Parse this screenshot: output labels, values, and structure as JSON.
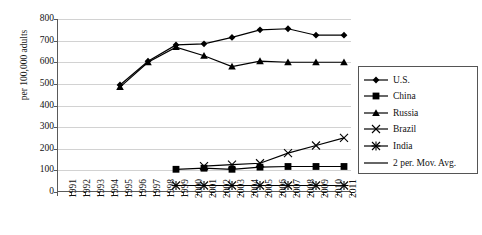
{
  "chart_data": {
    "type": "line",
    "title": "",
    "xlabel": "",
    "ylabel": "per 100,000 adults",
    "ylim": [
      0,
      800
    ],
    "ytick_step": 100,
    "grid": true,
    "legend_position": "right",
    "categories": [
      "1991",
      "1992",
      "1993",
      "1994",
      "1995",
      "1996",
      "1997",
      "1998",
      "1999",
      "2000",
      "2001",
      "2002",
      "2003",
      "2004",
      "2005",
      "2006",
      "2007",
      "2008",
      "2009",
      "2010",
      "2011"
    ],
    "yticks": [
      "0",
      "100",
      "200",
      "300",
      "400",
      "500",
      "600",
      "700",
      "800"
    ],
    "series": [
      {
        "name": "U.S.",
        "marker": "diamond",
        "x": [
          "1995",
          "1997",
          "1999",
          "2001",
          "2003",
          "2005",
          "2007",
          "2009",
          "2011"
        ],
        "values": [
          495,
          605,
          680,
          685,
          715,
          750,
          755,
          725,
          725
        ]
      },
      {
        "name": "China",
        "marker": "square",
        "x": [
          "1999",
          "2001",
          "2003",
          "2005",
          "2007",
          "2009",
          "2011"
        ],
        "values": [
          105,
          110,
          105,
          115,
          118,
          118,
          118
        ]
      },
      {
        "name": "Russia",
        "marker": "triangle",
        "x": [
          "1995",
          "1997",
          "1999",
          "2001",
          "2003",
          "2005",
          "2007",
          "2009",
          "2011"
        ],
        "values": [
          485,
          600,
          670,
          630,
          580,
          605,
          600,
          600,
          600
        ]
      },
      {
        "name": "Brazil",
        "marker": "x",
        "x": [
          "2001",
          "2003",
          "2005",
          "2007",
          "2009",
          "2011"
        ],
        "values": [
          120,
          127,
          133,
          180,
          215,
          250
        ]
      },
      {
        "name": "India",
        "marker": "asterisk",
        "x": [
          "1999",
          "2001",
          "2003",
          "2005",
          "2007",
          "2009",
          "2011"
        ],
        "values": [
          30,
          30,
          30,
          30,
          30,
          30,
          30
        ]
      }
    ],
    "legend_entries": [
      {
        "label": "U.S.",
        "marker": "diamond"
      },
      {
        "label": "China",
        "marker": "square"
      },
      {
        "label": "Russia",
        "marker": "triangle"
      },
      {
        "label": "Brazil",
        "marker": "x"
      },
      {
        "label": "India",
        "marker": "asterisk"
      },
      {
        "label": "2 per. Mov. Avg.",
        "marker": "line"
      }
    ],
    "series_color": "#000000",
    "grid_color": "#d2d2d2",
    "axis_color": "#5a5a5a"
  }
}
